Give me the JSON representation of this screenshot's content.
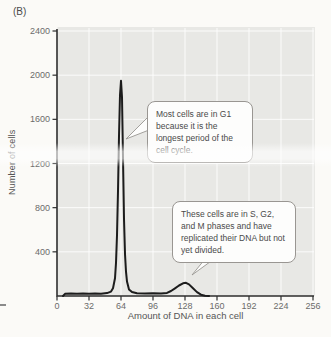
{
  "figure": {
    "panel_label": "(B)",
    "colors": {
      "page_bg": "#fbfaf7",
      "plot_bg": "#e8e8e5",
      "grid": "#ffffff",
      "axis": "#2e2e2e",
      "curve": "#1c1c1c",
      "tick_label": "#6b6b6b",
      "axis_label": "#555555",
      "callout_border": "#999692"
    }
  },
  "chart_data": {
    "type": "line",
    "title": "",
    "xlabel": "Amount of DNA in each cell",
    "ylabel": "Number of cells",
    "xlim": [
      0,
      256
    ],
    "ylim": [
      0,
      2400
    ],
    "x_ticks": [
      0,
      32,
      64,
      96,
      128,
      160,
      192,
      224,
      256
    ],
    "y_ticks": [
      400,
      800,
      1200,
      1600,
      2000,
      2400
    ],
    "grid": true,
    "legend": false,
    "series": [
      {
        "name": "Number of cells vs amount of DNA",
        "x": [
          6,
          8,
          14,
          20,
          26,
          32,
          38,
          44,
          50,
          54,
          56,
          58,
          59,
          60,
          61,
          62,
          63,
          64,
          65,
          66,
          67,
          68,
          69,
          70,
          72,
          75,
          80,
          88,
          96,
          104,
          110,
          114,
          118,
          122,
          126,
          129,
          132,
          136,
          140,
          144,
          148,
          152
        ],
        "y": [
          0,
          20,
          24,
          20,
          24,
          20,
          24,
          21,
          26,
          40,
          70,
          160,
          300,
          550,
          950,
          1450,
          1820,
          1950,
          1800,
          1250,
          700,
          380,
          220,
          130,
          60,
          35,
          25,
          22,
          25,
          22,
          28,
          45,
          70,
          95,
          115,
          120,
          105,
          70,
          35,
          12,
          3,
          0
        ]
      }
    ],
    "peaks": [
      {
        "x": 64,
        "y": 1950,
        "label": "G1 peak"
      },
      {
        "x": 128,
        "y": 120,
        "label": "G2/M peak"
      }
    ],
    "annotations": [
      {
        "id": "g1",
        "text": "Most cells are in G1 because it is the longest period of the cell cycle.",
        "points_to": {
          "x": 64
        }
      },
      {
        "id": "s-g2-m",
        "text": "These cells are in S, G2, and M phases and have replicated their DNA but not yet divided.",
        "points_to": {
          "x": 128
        }
      }
    ]
  }
}
